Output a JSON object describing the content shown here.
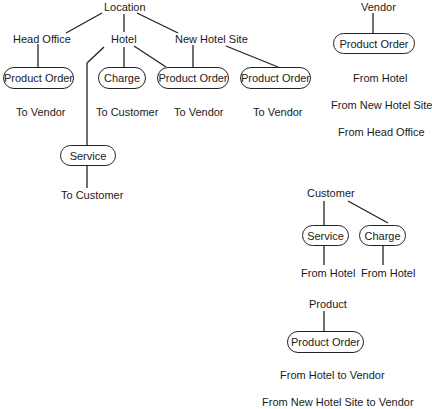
{
  "location_tree": {
    "root": "Location",
    "branches": {
      "head_office": {
        "label": "Head Office",
        "box": "Product Order",
        "note": "To Vendor"
      },
      "hotel": {
        "label": "Hotel",
        "charge_box": "Charge",
        "charge_note": "To Customer",
        "order_box": "Product Order",
        "order_note": "To Vendor",
        "service_box": "Service",
        "service_note": "To Customer"
      },
      "new_hotel_site": {
        "label": "New Hotel Site",
        "box": "Product Order",
        "note": "To Vendor"
      }
    }
  },
  "vendor_tree": {
    "root": "Vendor",
    "box": "Product Order",
    "notes": [
      "From Hotel",
      "From New Hotel Site",
      "From Head Office"
    ]
  },
  "customer_tree": {
    "root": "Customer",
    "service_box": "Service",
    "service_note": "From Hotel",
    "charge_box": "Charge",
    "charge_note": "From Hotel"
  },
  "product_tree": {
    "root": "Product",
    "box": "Product Order",
    "notes": [
      "From Hotel to Vendor",
      "From New Hotel Site to Vendor"
    ]
  }
}
